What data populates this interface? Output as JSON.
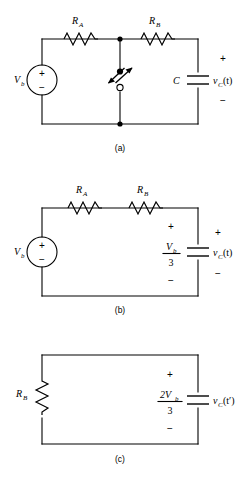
{
  "figure": {
    "background": "#ffffff",
    "ink_color": "#000000"
  },
  "circuits": [
    {
      "id": "a",
      "caption": "(a)",
      "components": {
        "source_label": "V",
        "source_sub": "b",
        "source_plus": "+",
        "source_minus": "−",
        "resistor_a_label": "R",
        "resistor_a_sub": "A",
        "resistor_b_label": "R",
        "resistor_b_sub": "B",
        "capacitor_label": "C",
        "cap_voltage_v": "v",
        "cap_voltage_sub": "C",
        "cap_voltage_arg": "(t)",
        "cap_plus": "+",
        "cap_minus": "−",
        "switch_name": "spdt-switch"
      }
    },
    {
      "id": "b",
      "caption": "(b)",
      "components": {
        "source_label": "V",
        "source_sub": "b",
        "source_plus": "+",
        "source_minus": "−",
        "resistor_a_label": "R",
        "resistor_a_sub": "A",
        "resistor_b_label": "R",
        "resistor_b_sub": "B",
        "cap_value_numer": "V",
        "cap_value_numer_sub": "b",
        "cap_value_denom": "3",
        "cap_value_plus": "+",
        "cap_value_minus": "−",
        "cap_voltage_v": "v",
        "cap_voltage_sub": "C",
        "cap_voltage_arg": "(t)",
        "cap_plus": "+",
        "cap_minus": "−"
      }
    },
    {
      "id": "c",
      "caption": "(c)",
      "components": {
        "resistor_b_label": "R",
        "resistor_b_sub": "B",
        "cap_value_numer": "2V",
        "cap_value_numer_sub": "b",
        "cap_value_denom": "3",
        "cap_value_plus": "+",
        "cap_value_minus": "−",
        "cap_voltage_v": "v",
        "cap_voltage_sub": "C",
        "cap_voltage_arg": "(t′)"
      }
    }
  ]
}
